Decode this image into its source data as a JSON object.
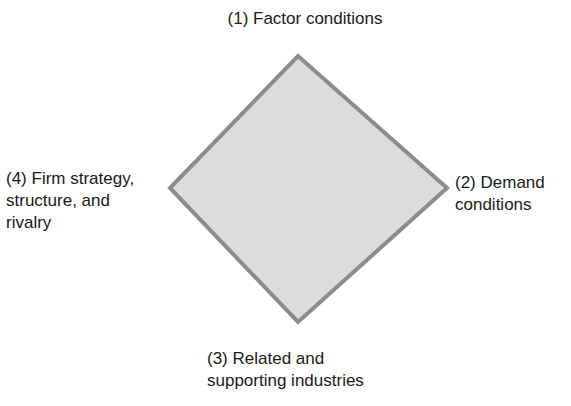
{
  "diagram": {
    "shape": {
      "type": "diamond",
      "fill": "#d9d9d9",
      "stroke": "#8c8c8c",
      "vertices": {
        "top": [
          298,
          56
        ],
        "right": [
          447,
          188
        ],
        "bottom": [
          298,
          322
        ],
        "left": [
          170,
          188
        ]
      }
    },
    "labels": {
      "top": "(1) Factor conditions",
      "right": "(2) Demand\nconditions",
      "bottom": "(3) Related and\nsupporting industries",
      "left": "(4) Firm strategy,\nstructure, and\nrivalry"
    }
  }
}
